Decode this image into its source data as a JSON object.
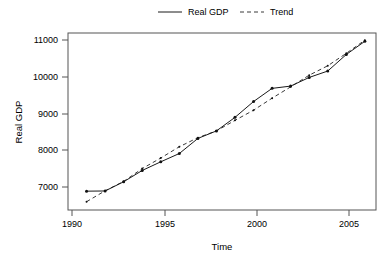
{
  "chart_data": {
    "type": "line",
    "title": "",
    "xlabel": "Time",
    "ylabel": "Real GDP",
    "xlim": [
      1990.0,
      2006.6
    ],
    "ylim": [
      6600,
      11300
    ],
    "xticks": [
      1990,
      1995,
      2000,
      2005
    ],
    "xtick_labels": [
      "1990",
      "1995",
      "2000",
      "2005"
    ],
    "yticks": [
      7000,
      8000,
      9000,
      10000,
      11000
    ],
    "ytick_labels": [
      "7000",
      "8000",
      "9000",
      "10000",
      "11000"
    ],
    "grid": false,
    "legend_position": "top-center",
    "x": [
      1991,
      1992,
      1993,
      1994,
      1995,
      1996,
      1997,
      1998,
      1999,
      2000,
      2001,
      2002,
      2003,
      2004,
      2005,
      2006
    ],
    "series": [
      {
        "name": "Real GDP",
        "style": "solid",
        "markers": true,
        "color": "#1a1a1a",
        "values": [
          7100,
          7105,
          7350,
          7650,
          7880,
          8100,
          8500,
          8700,
          9060,
          9480,
          9830,
          9890,
          10120,
          10290,
          10730,
          11080
        ]
      },
      {
        "name": "Trend",
        "style": "dashed",
        "markers": true,
        "color": "#3a3a3a",
        "values": [
          6820,
          7110,
          7360,
          7700,
          7980,
          8280,
          8520,
          8700,
          8980,
          9250,
          9570,
          9870,
          10180,
          10430,
          10760,
          11110
        ]
      }
    ],
    "legend": [
      {
        "label": "Real GDP",
        "style": "solid"
      },
      {
        "label": "Trend",
        "style": "dashed"
      }
    ]
  }
}
